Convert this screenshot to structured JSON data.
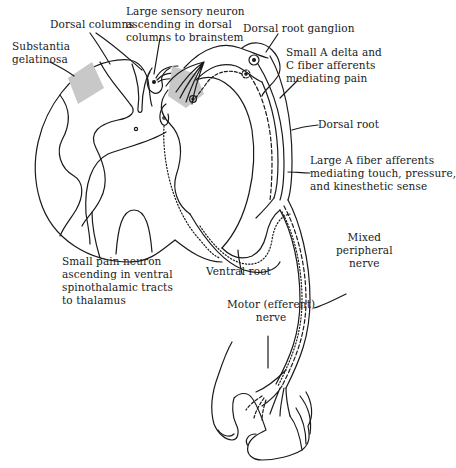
{
  "diagram": {
    "type": "anatomical-illustration",
    "colors": {
      "line": "#1a1a1a",
      "shade": "#c8c8c8",
      "background": "#ffffff"
    },
    "labels": {
      "dorsal_columns": [
        "Dorsal columns"
      ],
      "large_sensory_neuron": [
        "Large sensory neuron",
        "ascending in dorsal",
        "columns to brainstem"
      ],
      "substantia_gelatinosa": [
        "Substantia",
        "gelatinosa"
      ],
      "dorsal_root_ganglion": [
        "Dorsal root ganglion"
      ],
      "small_a_delta": [
        "Small A delta and",
        "C fiber afferents",
        "mediating pain"
      ],
      "dorsal_root": [
        "Dorsal root"
      ],
      "large_a_fiber": [
        "Large A fiber afferents",
        "mediating touch, pressure,",
        "and kinesthetic sense"
      ],
      "small_pain_neuron": [
        "Small pain neuron",
        "ascending in ventral",
        "spinothalamic tracts",
        "to thalamus"
      ],
      "ventral_root": [
        "Ventral root"
      ],
      "mixed_peripheral_nerve": [
        "Mixed",
        "peripheral",
        "nerve"
      ],
      "motor_nerve": [
        "Motor (efferent)",
        "nerve"
      ]
    },
    "structures": [
      "spinal-cord-cross-section",
      "gray-matter-butterfly",
      "central-canal",
      "substantia-gelatinosa-shaded-region",
      "dorsal-horn-shaded-region",
      "dorsal-root",
      "dorsal-root-ganglion",
      "ventral-root",
      "mixed-peripheral-nerve",
      "hand"
    ]
  }
}
